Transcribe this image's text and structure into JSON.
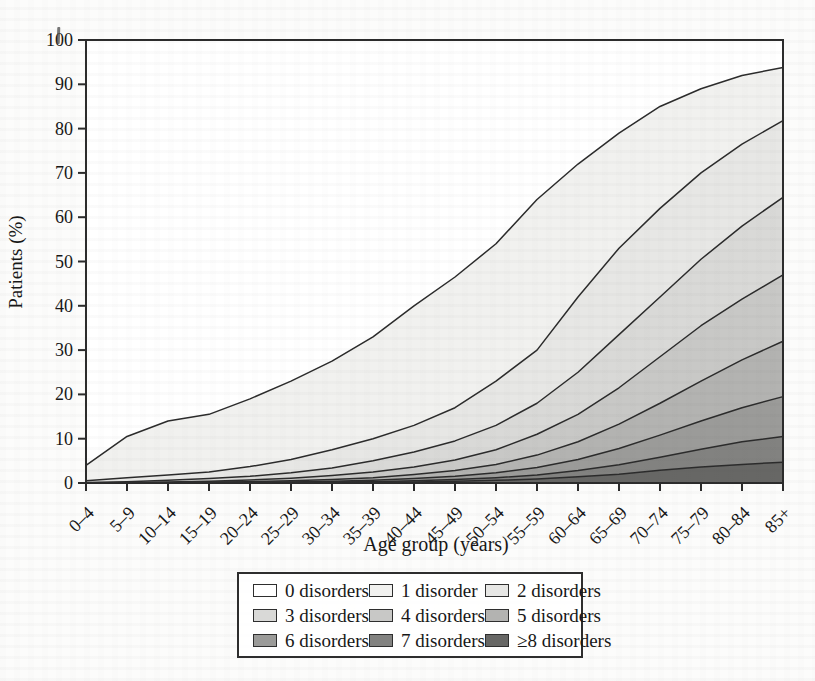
{
  "chart_data": {
    "type": "area",
    "variant": "stacked-area (100% population, bands = number of chronic disorders)",
    "title": "",
    "xlabel": "Age group (years)",
    "ylabel": "Patients (%)",
    "ylim": [
      0,
      100
    ],
    "y_ticks": [
      0,
      10,
      20,
      30,
      40,
      50,
      60,
      70,
      80,
      90,
      100
    ],
    "grid": false,
    "legend_position": "bottom",
    "line_color": "#2b2b2b",
    "categories": [
      "0–4",
      "5–9",
      "10–14",
      "15–19",
      "20–24",
      "25–29",
      "30–34",
      "35–39",
      "40–44",
      "45–49",
      "50–54",
      "55–59",
      "60–64",
      "65–69",
      "70–74",
      "75–79",
      "80–84",
      "85+"
    ],
    "series": [
      {
        "name": "0 disorders",
        "color": "#ffffff",
        "values": [
          96,
          89.5,
          86,
          84.5,
          81,
          77,
          72.5,
          67,
          60,
          53.5,
          46,
          36,
          28,
          21,
          15,
          11,
          8,
          6.2
        ]
      },
      {
        "name": "1 disorder",
        "color": "#f1f1ef",
        "values": [
          3.5,
          9.3,
          12.2,
          13,
          15.3,
          17.7,
          20,
          23,
          27,
          29.5,
          31,
          34,
          30,
          26,
          23,
          19,
          15.5,
          12
        ]
      },
      {
        "name": "2 disorders",
        "color": "#e7e7e5",
        "values": [
          0.4,
          0.9,
          1.2,
          1.5,
          2.2,
          3,
          4.1,
          5,
          6,
          7.5,
          10,
          12,
          17,
          19.5,
          20,
          19.5,
          18.5,
          17.3
        ]
      },
      {
        "name": "3 disorders",
        "color": "#d9d9d7",
        "values": [
          0.1,
          0.2,
          0.4,
          0.6,
          0.8,
          1.2,
          1.7,
          2.5,
          3.4,
          4.3,
          5.5,
          7,
          9.5,
          12,
          13.5,
          15,
          16.5,
          17.5
        ]
      },
      {
        "name": "4 disorders",
        "color": "#c8c8c6",
        "values": [
          0,
          0.1,
          0.1,
          0.2,
          0.4,
          0.6,
          0.9,
          1.3,
          1.7,
          2.4,
          3.3,
          4.7,
          6.2,
          8.2,
          10.5,
          12.5,
          13.7,
          15
        ]
      },
      {
        "name": "5 disorders",
        "color": "#b3b3b1",
        "values": [
          0,
          0,
          0.1,
          0.1,
          0.15,
          0.25,
          0.4,
          0.6,
          0.9,
          1.3,
          1.9,
          2.8,
          4,
          5.5,
          7.2,
          9,
          10.8,
          12.5
        ]
      },
      {
        "name": "6 disorders",
        "color": "#9b9b99",
        "values": [
          0,
          0,
          0,
          0.1,
          0.05,
          0.1,
          0.2,
          0.3,
          0.5,
          0.7,
          1.1,
          1.7,
          2.5,
          3.7,
          5,
          6.4,
          7.7,
          9
        ]
      },
      {
        "name": "7 disorders",
        "color": "#828280",
        "values": [
          0,
          0,
          0,
          0,
          0.1,
          0.1,
          0.1,
          0.15,
          0.25,
          0.4,
          0.6,
          0.9,
          1.4,
          2.1,
          2.9,
          4,
          5.1,
          5.8
        ]
      },
      {
        "name": "≥8 disorders",
        "color": "#676765",
        "values": [
          0,
          0,
          0,
          0,
          0,
          0.05,
          0.1,
          0.15,
          0.25,
          0.4,
          0.6,
          0.9,
          1.4,
          2,
          2.9,
          3.6,
          4.2,
          4.7
        ]
      }
    ],
    "cumulative_at_least_k_pct": {
      "1": [
        4,
        10.5,
        14,
        15.5,
        19,
        23,
        27.5,
        33,
        40,
        46.5,
        54,
        64,
        72,
        79,
        85,
        89,
        92,
        93.8
      ],
      "2": [
        0.5,
        1.2,
        1.8,
        2.5,
        3.7,
        5.3,
        7.5,
        10,
        13,
        17,
        23,
        30,
        42,
        53,
        62,
        70,
        76.5,
        81.8
      ],
      "3": [
        0.1,
        0.3,
        0.6,
        1,
        1.5,
        2.3,
        3.4,
        5,
        7,
        9.5,
        13,
        18,
        25,
        33.5,
        42,
        50.5,
        58,
        64.5
      ],
      "4": [
        0,
        0.1,
        0.2,
        0.4,
        0.7,
        1.1,
        1.7,
        2.5,
        3.6,
        5.2,
        7.5,
        11,
        15.5,
        21.5,
        28.5,
        35.5,
        41.5,
        47
      ],
      "5": [
        0,
        0,
        0.1,
        0.2,
        0.3,
        0.5,
        0.8,
        1.2,
        1.9,
        2.8,
        4.2,
        6.3,
        9.3,
        13.3,
        18,
        23,
        27.8,
        32
      ],
      "6": [
        0,
        0,
        0,
        0.1,
        0.15,
        0.25,
        0.4,
        0.6,
        1,
        1.5,
        2.3,
        3.5,
        5.3,
        7.8,
        10.8,
        14,
        17,
        19.5
      ],
      "7": [
        0,
        0,
        0,
        0,
        0.1,
        0.15,
        0.2,
        0.3,
        0.5,
        0.8,
        1.2,
        1.8,
        2.8,
        4.1,
        5.8,
        7.6,
        9.3,
        10.5
      ],
      "8": [
        0,
        0,
        0,
        0,
        0,
        0.05,
        0.1,
        0.15,
        0.25,
        0.4,
        0.6,
        0.9,
        1.4,
        2,
        2.9,
        3.6,
        4.2,
        4.7
      ]
    }
  }
}
